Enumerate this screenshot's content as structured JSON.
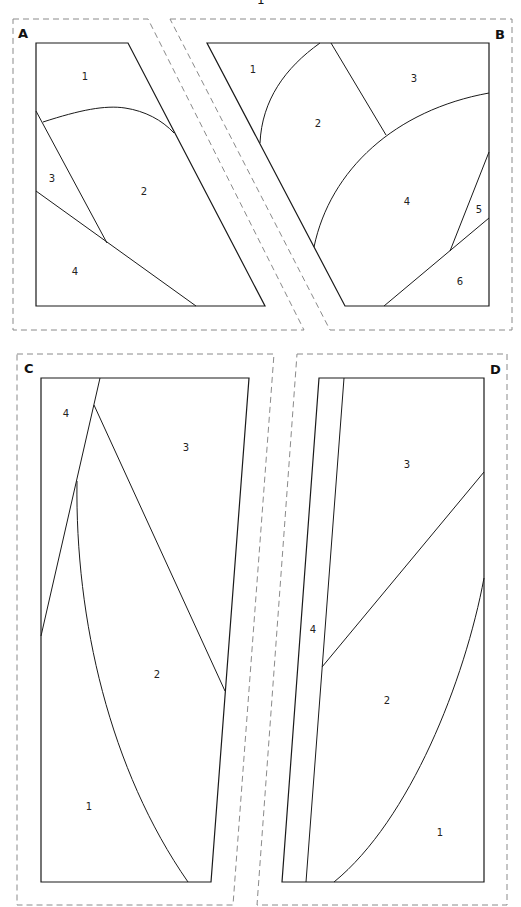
{
  "title_fragment": "1",
  "panels": {
    "A": {
      "label": "A",
      "pieces": [
        {
          "num": "1",
          "x": 85,
          "y": 80
        },
        {
          "num": "2",
          "x": 144,
          "y": 195
        },
        {
          "num": "3",
          "x": 52,
          "y": 182
        },
        {
          "num": "4",
          "x": 75,
          "y": 275
        }
      ]
    },
    "B": {
      "label": "B",
      "pieces": [
        {
          "num": "1",
          "x": 253,
          "y": 73
        },
        {
          "num": "2",
          "x": 318,
          "y": 127
        },
        {
          "num": "3",
          "x": 414,
          "y": 82
        },
        {
          "num": "4",
          "x": 407,
          "y": 205
        },
        {
          "num": "5",
          "x": 479,
          "y": 213
        },
        {
          "num": "6",
          "x": 460,
          "y": 285
        }
      ]
    },
    "C": {
      "label": "C",
      "pieces": [
        {
          "num": "1",
          "x": 89,
          "y": 810
        },
        {
          "num": "2",
          "x": 157,
          "y": 678
        },
        {
          "num": "3",
          "x": 186,
          "y": 451
        },
        {
          "num": "4",
          "x": 66,
          "y": 417
        }
      ]
    },
    "D": {
      "label": "D",
      "pieces": [
        {
          "num": "1",
          "x": 440,
          "y": 836
        },
        {
          "num": "2",
          "x": 387,
          "y": 704
        },
        {
          "num": "3",
          "x": 407,
          "y": 468
        },
        {
          "num": "4",
          "x": 313,
          "y": 633
        }
      ]
    }
  },
  "colors": {
    "outline": "#1a1a1a",
    "seam_allowance_dash": "#8a8a8a",
    "background": "#ffffff"
  }
}
